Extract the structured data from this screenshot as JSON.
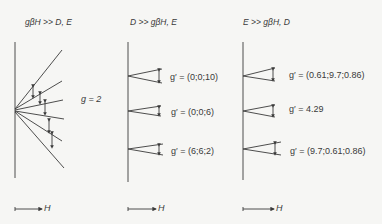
{
  "panels": [
    {
      "title": "gβH >> D, E",
      "label": "g = 2",
      "axis": "H"
    },
    {
      "title": "D >> gβH, E",
      "values": [
        "g′ = (0;0;10)",
        "g′ = (0;0;6)",
        "g′ = (6;6;2)"
      ],
      "axis": "H"
    },
    {
      "title": "E >> gβH, D",
      "values": [
        "g′ = (0.61;9.7;0.86)",
        "g′ = 4.29",
        "g′ = (9.7;0.61;0.86)"
      ],
      "axis": "H"
    }
  ],
  "colors": {
    "line": "#3a3a3a",
    "background": "#f6f6f4"
  }
}
